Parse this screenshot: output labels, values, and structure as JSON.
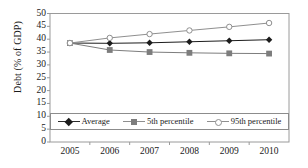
{
  "chart_data": {
    "type": "line",
    "title": "",
    "xlabel": "",
    "ylabel": "Debt (% of GDP)",
    "categories": [
      "2005",
      "2006",
      "2007",
      "2008",
      "2009",
      "2010"
    ],
    "x": [
      2005,
      2006,
      2007,
      2008,
      2009,
      2010
    ],
    "ylim": [
      0,
      50
    ],
    "yticks": [
      "0",
      "5",
      "10",
      "15",
      "20",
      "25",
      "30",
      "35",
      "40",
      "45",
      "50"
    ],
    "ytick_values": [
      0,
      5,
      10,
      15,
      20,
      25,
      30,
      35,
      40,
      45,
      50
    ],
    "grid": false,
    "legend_position": "bottom",
    "series": [
      {
        "name": "Average",
        "marker": "diamond",
        "color": "#1c1c1c",
        "values": [
          38.5,
          38.4,
          38.6,
          39.0,
          39.4,
          39.8
        ]
      },
      {
        "name": "5th percentile",
        "marker": "square",
        "color": "#7d7d7d",
        "values": [
          38.5,
          35.8,
          35.0,
          34.7,
          34.5,
          34.4
        ]
      },
      {
        "name": "95th percentile",
        "marker": "circle",
        "color": "#8f8f8f",
        "values": [
          38.5,
          40.5,
          42.0,
          43.4,
          44.8,
          46.3
        ]
      }
    ]
  },
  "axis": {
    "ylabel": "Debt (% of GDP)"
  },
  "legend": {
    "items": [
      {
        "label": "Average"
      },
      {
        "label": "5th percentile"
      },
      {
        "label": "95th percentile"
      }
    ]
  }
}
